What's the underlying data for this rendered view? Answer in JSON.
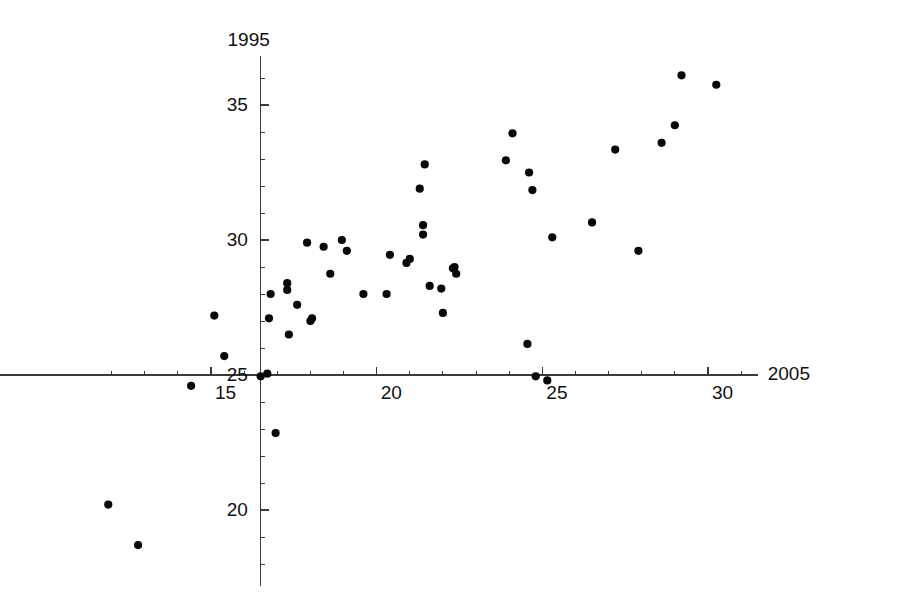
{
  "figure": {
    "width": 900,
    "height": 603,
    "background": "#ffffff",
    "marker_color": "#080808",
    "axis_color": "#3a3a3a"
  },
  "chart_data": {
    "type": "scatter",
    "title": "",
    "subtitle": "",
    "xlabel": "2005",
    "ylabel": "1995",
    "grid": false,
    "legend": null,
    "xlim": [
      11.2,
      31.5
    ],
    "ylim": [
      17.2,
      36.8
    ],
    "x_ticks_major": [
      15,
      20,
      25,
      30
    ],
    "x_tick_labels": [
      "15",
      "20",
      "25",
      "30"
    ],
    "y_ticks_major": [
      20,
      25,
      30,
      35
    ],
    "y_tick_labels": [
      "20",
      "25",
      "30",
      "35"
    ],
    "x_tick_minor_step": 1,
    "y_tick_minor_step": 1,
    "axis_origin": [
      16.5,
      25
    ],
    "n_points": 52,
    "points": [
      [
        11.9,
        20.2
      ],
      [
        12.8,
        18.7
      ],
      [
        14.4,
        24.6
      ],
      [
        15.1,
        27.2
      ],
      [
        15.4,
        25.7
      ],
      [
        16.5,
        24.95
      ],
      [
        16.7,
        25.05
      ],
      [
        16.8,
        28.0
      ],
      [
        16.75,
        27.1
      ],
      [
        16.95,
        22.85
      ],
      [
        17.3,
        28.4
      ],
      [
        17.3,
        28.15
      ],
      [
        17.35,
        26.5
      ],
      [
        17.6,
        27.6
      ],
      [
        17.9,
        29.9
      ],
      [
        18.0,
        27.0
      ],
      [
        18.05,
        27.1
      ],
      [
        18.4,
        29.75
      ],
      [
        18.6,
        28.75
      ],
      [
        18.95,
        30.0
      ],
      [
        19.1,
        29.6
      ],
      [
        19.6,
        28.0
      ],
      [
        20.3,
        28.0
      ],
      [
        20.4,
        29.45
      ],
      [
        20.9,
        29.15
      ],
      [
        21.0,
        29.3
      ],
      [
        21.3,
        31.9
      ],
      [
        21.4,
        30.55
      ],
      [
        21.45,
        32.8
      ],
      [
        21.4,
        30.2
      ],
      [
        21.6,
        28.3
      ],
      [
        21.95,
        28.2
      ],
      [
        22.0,
        27.3
      ],
      [
        22.3,
        28.95
      ],
      [
        22.35,
        29.0
      ],
      [
        22.4,
        28.75
      ],
      [
        23.9,
        32.95
      ],
      [
        24.1,
        33.95
      ],
      [
        24.55,
        26.15
      ],
      [
        24.6,
        32.5
      ],
      [
        24.7,
        31.85
      ],
      [
        24.8,
        24.95
      ],
      [
        25.15,
        24.8
      ],
      [
        25.3,
        30.1
      ],
      [
        26.5,
        30.65
      ],
      [
        27.2,
        33.35
      ],
      [
        27.9,
        29.6
      ],
      [
        28.6,
        33.6
      ],
      [
        29.0,
        34.25
      ],
      [
        29.2,
        36.1
      ],
      [
        30.25,
        35.75
      ]
    ]
  }
}
